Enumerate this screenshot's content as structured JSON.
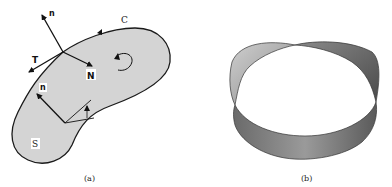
{
  "figure": {
    "panels": [
      {
        "id": "a",
        "caption": "(a)",
        "description": "Surface S bounded by closed curve C with normals and tangents",
        "labels": {
          "curve": "C",
          "surface": "S",
          "normal_top": "n",
          "tangent": "T",
          "principal_normal": "N",
          "normal_inner": "n"
        },
        "colors": {
          "surface_fill": "#d4d4d4",
          "outline": "#1a1a1a"
        }
      },
      {
        "id": "b",
        "caption": "(b)",
        "description": "Möbius strip",
        "colors": {
          "strip_dark": "#555555",
          "strip_light": "#bdbdbd"
        }
      }
    ]
  }
}
